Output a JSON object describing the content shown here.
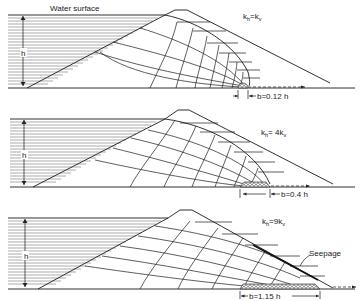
{
  "figure": {
    "labels": {
      "water_surface": "Water surface",
      "height": "h",
      "seepage": "Seepage"
    },
    "panels": [
      {
        "id": "panel-1",
        "anisotropy": {
          "k": "k",
          "h_sub": "h",
          "eq": "=",
          "coef": "",
          "v": "k",
          "v_sub": "v"
        },
        "drain_width": "b=0.12 h"
      },
      {
        "id": "panel-2",
        "anisotropy": {
          "k": "k",
          "h_sub": "h",
          "eq": "= ",
          "coef": "4",
          "v": "k",
          "v_sub": "v"
        },
        "drain_width": "b=0.4 h"
      },
      {
        "id": "panel-3",
        "anisotropy": {
          "k": "k",
          "h_sub": "h",
          "eq": "=",
          "coef": "9",
          "v": "k",
          "v_sub": "v"
        },
        "drain_width": "b=1.15 h"
      }
    ],
    "colors": {
      "line": "#1a1a1a",
      "background": "#ffffff"
    }
  }
}
